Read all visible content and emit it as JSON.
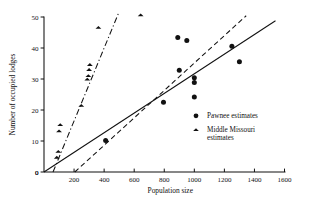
{
  "chart_data": {
    "type": "scatter",
    "title": "",
    "xlabel": "Population size",
    "ylabel": "Number of occupied lodges",
    "xlim": [
      0,
      1600
    ],
    "ylim": [
      0,
      50
    ],
    "xticks": [
      0,
      200,
      400,
      600,
      800,
      1000,
      1200,
      1400,
      1600
    ],
    "yticks": [
      0,
      10,
      20,
      30,
      40,
      50
    ],
    "xtick_labels": [
      "0",
      "200",
      "400",
      "600",
      "800",
      "1000",
      "1200",
      "1400",
      "1600"
    ],
    "ytick_labels": [
      "0",
      "10",
      "20",
      "30",
      "40",
      "50"
    ],
    "grid": false,
    "legend_position": "inside-right",
    "series": [
      {
        "name": "Pawnee estimates",
        "marker": "circle",
        "color": "#111111",
        "points": [
          [
            410,
            10.2
          ],
          [
            795,
            22.5
          ],
          [
            890,
            43.4
          ],
          [
            900,
            32.8
          ],
          [
            950,
            42.4
          ],
          [
            1000,
            30.4
          ],
          [
            1000,
            28.9
          ],
          [
            1000,
            24.2
          ],
          [
            1250,
            40.6
          ],
          [
            1300,
            35.6
          ]
        ]
      },
      {
        "name": "Middle Missouri estimates",
        "marker": "triangle",
        "color": "#111111",
        "points": [
          [
            85,
            4.7
          ],
          [
            95,
            6.6
          ],
          [
            100,
            13.2
          ],
          [
            108,
            15.2
          ],
          [
            248,
            21.4
          ],
          [
            288,
            29.9
          ],
          [
            295,
            31.0
          ],
          [
            300,
            33.0
          ],
          [
            305,
            34.6
          ],
          [
            362,
            46.6
          ],
          [
            643,
            50.6
          ]
        ]
      }
    ],
    "fit_lines": [
      {
        "name": "middle-missouri-fit",
        "style": "dash-dot",
        "x0": 60,
        "y0": 0.0,
        "x1": 498,
        "y1": 51.5
      },
      {
        "name": "pawnee-fit",
        "style": "solid",
        "x0": 0,
        "y0": 0.0,
        "x1": 1540,
        "y1": 48.8
      },
      {
        "name": "combined-fit",
        "style": "dashed",
        "x0": 205,
        "y0": 0.0,
        "x1": 1345,
        "y1": 50.4
      }
    ]
  },
  "legend": {
    "entries": [
      {
        "label": "Pawnee estimates",
        "label_line2": "",
        "marker": "circle"
      },
      {
        "label": "Middle Missouri",
        "label_line2": "estimates",
        "marker": "triangle"
      }
    ]
  },
  "axes": {
    "x_title": "Population size",
    "y_title": "Number of occupied lodges"
  }
}
